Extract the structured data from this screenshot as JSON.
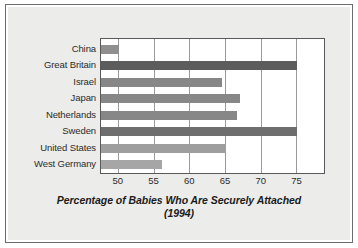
{
  "chart_data": {
    "type": "bar",
    "orientation": "horizontal",
    "title": "Percentage of Babies Who Are Securely Attached",
    "subtitle": "(1994)",
    "xlabel": "",
    "ylabel": "",
    "xlim": [
      47.5,
      79
    ],
    "ticks": [
      "50",
      "55",
      "60",
      "65",
      "70",
      "75"
    ],
    "tick_values": [
      50,
      55,
      60,
      65,
      70,
      75
    ],
    "grid": true,
    "legend": "none",
    "categories": [
      "China",
      "Great Britain",
      "Israel",
      "Japan",
      "Netherlands",
      "Sweden",
      "United States",
      "West Germany"
    ],
    "values": [
      50,
      75,
      64.5,
      67,
      66.5,
      75,
      65,
      56
    ],
    "bar_colors": [
      "#8f8f8f",
      "#5c5c5c",
      "#878787",
      "#878787",
      "#878787",
      "#6e6e6e",
      "#9e9e9e",
      "#a6a6a6"
    ]
  },
  "style": {
    "panel_background": "#ececea",
    "plot_background": "#ffffff",
    "frame_color": "#6d6d6d",
    "axis_color": "#595959",
    "grid_color": "#9a9a9a",
    "text_color": "#2b2b2b"
  }
}
